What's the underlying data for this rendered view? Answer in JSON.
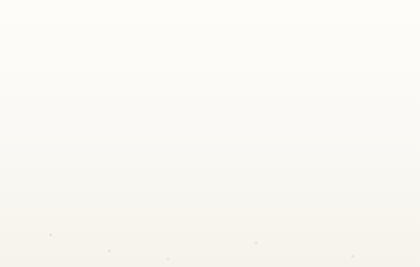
{
  "page": {
    "body_text_fragment": "converted to proven reserves in several ways."
  },
  "chart_data": {
    "type": "area",
    "title": "",
    "xlabel": "Year",
    "ylabel": "Million barrels per day",
    "xlim": [
      1990,
      2035
    ],
    "ylim": [
      0,
      100
    ],
    "grid": true,
    "stacked": true,
    "legend_position": "inside-lower-left",
    "xticks": [
      1990,
      1995,
      2000,
      2005,
      2010,
      2015,
      2020,
      2025,
      2030,
      2035
    ],
    "yticks": [
      0,
      10,
      20,
      30,
      40,
      50,
      60,
      70,
      80,
      90,
      100
    ],
    "x": [
      1990,
      1992,
      1994,
      1996,
      1998,
      2000,
      2002,
      2004,
      2006,
      2008,
      2010,
      2012,
      2014,
      2016,
      2018,
      2020,
      2022,
      2024,
      2026,
      2028,
      2030,
      2032,
      2035
    ],
    "series": [
      {
        "name": "Crude oil, fields producing",
        "color": "#8a8a8a",
        "order": 1,
        "values": [
          65.0,
          65.0,
          65.6,
          66.5,
          67.2,
          68.3,
          68.6,
          69.8,
          70.0,
          69.6,
          68.4,
          64.0,
          59.0,
          54.0,
          49.0,
          44.0,
          40.0,
          36.5,
          33.0,
          30.0,
          27.5,
          25.5,
          23.0
        ]
      },
      {
        "name": "Crude oil, fields yet to be developed",
        "color": "#a8a8a8",
        "order": 2,
        "values": [
          0.0,
          0.0,
          0.0,
          0.0,
          0.0,
          0.0,
          0.3,
          0.8,
          1.5,
          2.6,
          4.2,
          7.5,
          11.0,
          14.5,
          17.5,
          20.0,
          21.8,
          23.2,
          24.2,
          25.0,
          25.6,
          26.0,
          26.5
        ]
      },
      {
        "name": "Crude oil, fields yet to be discovered",
        "color": "#d6d4ce",
        "order": 3,
        "values": [
          0.0,
          0.0,
          0.0,
          0.0,
          0.0,
          0.0,
          0.0,
          0.0,
          0.0,
          0.4,
          1.2,
          3.0,
          5.4,
          8.0,
          10.5,
          12.8,
          14.8,
          16.5,
          18.0,
          19.2,
          20.2,
          21.0,
          22.0
        ]
      },
      {
        "name": "Natural gas liquids",
        "color": "#8d8d8d",
        "order": 4,
        "values": [
          0.0,
          0.4,
          1.0,
          1.8,
          2.6,
          3.5,
          4.3,
          4.8,
          5.2,
          5.6,
          6.0,
          6.6,
          7.2,
          7.8,
          8.4,
          9.0,
          9.6,
          10.1,
          10.6,
          11.1,
          11.6,
          12.0,
          12.6
        ]
      },
      {
        "name": "Unconventional oil",
        "color": "#7a7a7a",
        "order": 5,
        "values": [
          0.0,
          0.2,
          0.5,
          0.9,
          1.3,
          1.7,
          2.0,
          2.4,
          2.8,
          3.2,
          3.6,
          4.0,
          4.6,
          5.2,
          5.8,
          6.6,
          7.4,
          8.2,
          9.2,
          10.2,
          11.4,
          12.4,
          13.9
        ]
      }
    ],
    "stack_top_total": [
      65.0,
      65.6,
      67.1,
      69.2,
      71.1,
      73.5,
      75.2,
      77.8,
      79.5,
      81.4,
      83.4,
      85.1,
      87.2,
      89.5,
      91.2,
      92.4,
      93.6,
      94.5,
      95.0,
      95.5,
      96.3,
      96.9,
      98.0
    ]
  },
  "legend": {
    "items": [
      {
        "label": "Unconventional oil",
        "color": "#7a7a7a"
      },
      {
        "label": "Natural gas liquids",
        "color": "#8d8d8d"
      },
      {
        "label": "Crude oil, fields yet to be discovered",
        "color": "#d6d4ce"
      },
      {
        "label": "Crude oil, fields yet to be developed",
        "color": "#a8a8a8"
      },
      {
        "label": "Crude oil, fields producing",
        "color": "#8a8a8a"
      }
    ]
  }
}
